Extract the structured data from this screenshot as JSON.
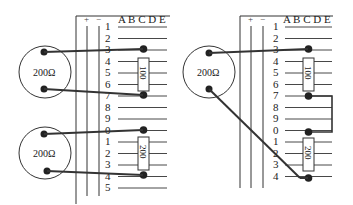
{
  "figures": [
    {
      "id": "left",
      "column_header": "A B C D E",
      "rail_labels": [
        "+",
        "−"
      ],
      "row_numbers": [
        "1",
        "2",
        "3",
        "4",
        "5",
        "6",
        "7",
        "8",
        "9",
        "0",
        "1",
        "2",
        "3",
        "4",
        "5"
      ],
      "meters": [
        {
          "label": "200Ω"
        },
        {
          "label": "200Ω"
        }
      ],
      "resistors": [
        {
          "label": "100",
          "from_row": 3,
          "to_row": 7
        },
        {
          "label": "200",
          "from_row": 10,
          "to_row": 14
        }
      ]
    },
    {
      "id": "right",
      "column_header": "A B C D E",
      "rail_labels": [
        "+",
        "−"
      ],
      "row_numbers": [
        "1",
        "2",
        "3",
        "4",
        "5",
        "6",
        "7",
        "8",
        "9",
        "0",
        "1",
        "2",
        "3",
        "4"
      ],
      "meters": [
        {
          "label": "200Ω"
        }
      ],
      "resistors": [
        {
          "label": "100",
          "from_row": 3,
          "to_row": 7
        },
        {
          "label": "200",
          "from_row": 10,
          "to_row": 14
        }
      ],
      "jumper": {
        "from_row": 7,
        "to_row": 10
      }
    }
  ]
}
